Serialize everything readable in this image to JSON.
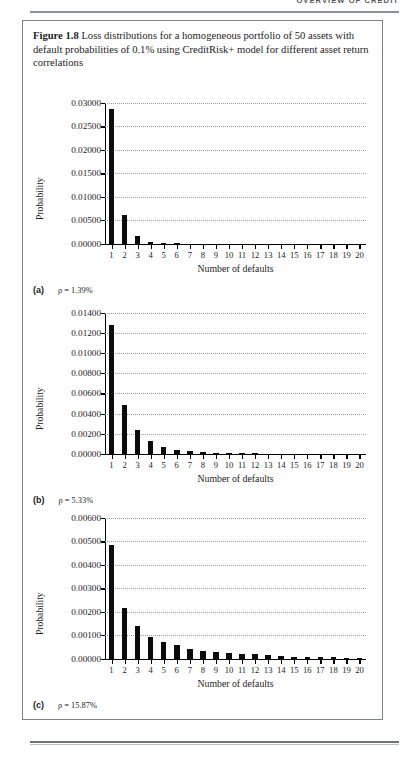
{
  "running_head": {
    "text": "OVERVIEW OF CREDIT"
  },
  "figure": {
    "label": "Figure 1.8",
    "caption": "Loss distributions for a homogeneous portfolio of 50 assets with default probabilities of 0.1% using CreditRisk+ model for different asset return correlations"
  },
  "panels": [
    {
      "letter": "(a)",
      "rho": "ρ = 1.39%"
    },
    {
      "letter": "(b)",
      "rho": "ρ = 5.33%"
    },
    {
      "letter": "(c)",
      "rho": "ρ = 15.87%"
    }
  ],
  "chart_data": [
    {
      "type": "bar",
      "panel": "(a)",
      "title": "",
      "xlabel": "Number of defaults",
      "ylabel": "Probability",
      "categories": [
        "1",
        "2",
        "3",
        "4",
        "5",
        "6",
        "7",
        "8",
        "9",
        "10",
        "11",
        "12",
        "13",
        "14",
        "15",
        "16",
        "17",
        "18",
        "19",
        "20"
      ],
      "values": [
        0.0287,
        0.0062,
        0.0016,
        0.00045,
        0.00018,
        6e-05,
        2e-05,
        1e-05,
        5e-06,
        2e-06,
        1e-06,
        0,
        0,
        0,
        0,
        0,
        0,
        0,
        0,
        0
      ],
      "ylim": [
        0,
        0.03
      ],
      "yticks": [
        0.0,
        0.005,
        0.01,
        0.015,
        0.02,
        0.025,
        0.03
      ],
      "ytick_labels": [
        "0.00000",
        "0.00500",
        "0.01000",
        "0.01500",
        "0.02000",
        "0.02500",
        "0.03000"
      ],
      "grid": true,
      "legend": "none"
    },
    {
      "type": "bar",
      "panel": "(b)",
      "title": "",
      "xlabel": "Number of defaults",
      "ylabel": "Probability",
      "categories": [
        "1",
        "2",
        "3",
        "4",
        "5",
        "6",
        "7",
        "8",
        "9",
        "10",
        "11",
        "12",
        "13",
        "14",
        "15",
        "16",
        "17",
        "18",
        "19",
        "20"
      ],
      "values": [
        0.0128,
        0.0048,
        0.0024,
        0.00122,
        0.00065,
        0.0004,
        0.00027,
        0.00015,
        0.00012,
        8e-05,
        6e-05,
        3e-05,
        2e-05,
        1e-05,
        8e-06,
        5e-06,
        3e-06,
        2e-06,
        1e-06,
        1e-06
      ],
      "ylim": [
        0,
        0.014
      ],
      "yticks": [
        0.0,
        0.002,
        0.004,
        0.006,
        0.008,
        0.01,
        0.012,
        0.014
      ],
      "ytick_labels": [
        "0.00000",
        "0.00200",
        "0.00400",
        "0.00600",
        "0.00800",
        "0.01000",
        "0.01200",
        "0.01400"
      ],
      "grid": true,
      "legend": "none"
    },
    {
      "type": "bar",
      "panel": "(c)",
      "title": "",
      "xlabel": "Number of defaults",
      "ylabel": "Probability",
      "categories": [
        "1",
        "2",
        "3",
        "4",
        "5",
        "6",
        "7",
        "8",
        "9",
        "10",
        "11",
        "12",
        "13",
        "14",
        "15",
        "16",
        "17",
        "18",
        "19",
        "20"
      ],
      "values": [
        0.00485,
        0.00218,
        0.0014,
        0.00092,
        0.0007,
        0.00058,
        0.00041,
        0.00033,
        0.00028,
        0.00024,
        0.0002,
        0.00018,
        0.00017,
        0.0001,
        7e-05,
        7e-05,
        6e-05,
        6e-05,
        5e-05,
        5e-05
      ],
      "ylim": [
        0,
        0.006
      ],
      "yticks": [
        0.0,
        0.001,
        0.002,
        0.003,
        0.004,
        0.005,
        0.006
      ],
      "ytick_labels": [
        "0.00000",
        "0.00100",
        "0.00200",
        "0.00300",
        "0.00400",
        "0.00500",
        "0.00600"
      ],
      "grid": true,
      "legend": "none"
    }
  ]
}
